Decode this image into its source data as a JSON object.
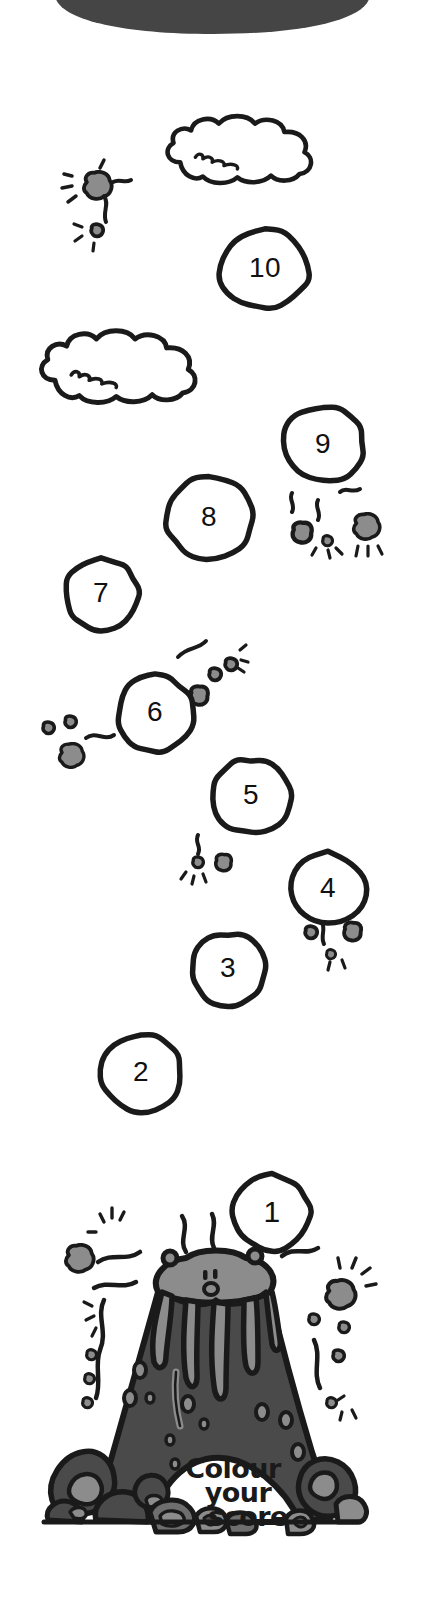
{
  "page": {
    "width": 427,
    "height": 1610,
    "background_color": "#ffffff"
  },
  "banner": {
    "name": "top-banner-shape",
    "color": "#454545"
  },
  "colors": {
    "outline": "#1a1a1a",
    "rock_light": "#8c8c8c",
    "rock_mid": "#6e6e6e",
    "rock_dark": "#4a4a4a",
    "volcano_body": "#4a4a4a",
    "volcano_crater": "#8c8c8c",
    "lava_drip": "#8c8c8c",
    "banner_dark": "#454545",
    "white": "#ffffff",
    "text": "#1a1a1a"
  },
  "score_markers": [
    {
      "label": "10",
      "x": 265,
      "y": 269,
      "rx": 46,
      "ry": 40,
      "font_size": 28,
      "shape": "round-blob",
      "seed": 11
    },
    {
      "label": "9",
      "x": 323,
      "y": 445,
      "rx": 41,
      "ry": 39,
      "font_size": 28,
      "shape": "round-blob",
      "seed": 29
    },
    {
      "label": "8",
      "x": 209,
      "y": 518,
      "rx": 44,
      "ry": 41,
      "font_size": 28,
      "shape": "round-blob",
      "seed": 37
    },
    {
      "label": "7",
      "x": 101,
      "y": 594,
      "rx": 38,
      "ry": 38,
      "font_size": 28,
      "shape": "round-blob",
      "seed": 53
    },
    {
      "label": "6",
      "x": 155,
      "y": 713,
      "rx": 39,
      "ry": 39,
      "font_size": 28,
      "shape": "round-blob",
      "seed": 61
    },
    {
      "label": "5",
      "x": 251,
      "y": 796,
      "rx": 40,
      "ry": 38,
      "font_size": 28,
      "shape": "round-blob",
      "seed": 73
    },
    {
      "label": "4",
      "x": 328,
      "y": 889,
      "rx": 41,
      "ry": 38,
      "font_size": 28,
      "shape": "rock-blob",
      "seed": 83
    },
    {
      "label": "3",
      "x": 228,
      "y": 969,
      "rx": 39,
      "ry": 37,
      "font_size": 28,
      "shape": "round-blob",
      "seed": 97
    },
    {
      "label": "2",
      "x": 141,
      "y": 1073,
      "rx": 41,
      "ry": 40,
      "font_size": 28,
      "shape": "round-blob",
      "seed": 103
    },
    {
      "label": "1",
      "x": 272,
      "y": 1213,
      "rx": 40,
      "ry": 39,
      "font_size": 30,
      "shape": "round-blob",
      "seed": 113
    }
  ],
  "clouds": [
    {
      "name": "cloud-upper",
      "x": 155,
      "y": 113,
      "w": 165,
      "h": 68
    },
    {
      "name": "cloud-lower",
      "x": 30,
      "y": 327,
      "w": 175,
      "h": 78
    }
  ],
  "debris_clusters": [
    {
      "name": "debris-top-left",
      "x": 65,
      "y": 165,
      "rocks": 2
    },
    {
      "name": "debris-nine",
      "x": 282,
      "y": 488,
      "rocks": 3
    },
    {
      "name": "debris-six-right",
      "x": 178,
      "y": 632,
      "rocks": 3
    },
    {
      "name": "debris-six-left",
      "x": 38,
      "y": 690,
      "rocks": 3
    },
    {
      "name": "debris-five",
      "x": 182,
      "y": 800,
      "rocks": 3
    },
    {
      "name": "debris-four",
      "x": 300,
      "y": 915,
      "rocks": 3
    },
    {
      "name": "debris-volcano-left",
      "x": 55,
      "y": 1215,
      "rocks": 4
    },
    {
      "name": "debris-volcano-right",
      "x": 320,
      "y": 1245,
      "rocks": 4
    }
  ],
  "volcano": {
    "name": "volcano",
    "crater_face": {
      "eyes": 2,
      "nose": 1,
      "mouth": "smile"
    },
    "score_caption": {
      "line1": "Colour",
      "line2": "your",
      "line3": "score",
      "font_size": 27,
      "color": "#1a1a1a"
    }
  }
}
